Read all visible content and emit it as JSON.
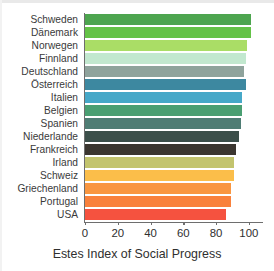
{
  "chart_data": {
    "type": "bar",
    "orientation": "horizontal",
    "title": "",
    "xlabel": "Estes Index of Social Progress",
    "ylabel": "",
    "xlim": [
      0,
      108
    ],
    "axis_max_tick": 100,
    "xticks": [
      0,
      20,
      40,
      60,
      80,
      100
    ],
    "xtick_labels": [
      "0",
      "20",
      "40",
      "60",
      "80",
      "100"
    ],
    "grid": false,
    "legend": null,
    "categories": [
      "Schweden",
      "Dänemark",
      "Norwegen",
      "Finnland",
      "Deutschland",
      "Österreich",
      "Italien",
      "Belgien",
      "Spanien",
      "Niederlande",
      "Frankreich",
      "Irland",
      "Schweiz",
      "Griechenland",
      "Portugal",
      "USA"
    ],
    "values": [
      101,
      101,
      99,
      98,
      97,
      98,
      96,
      96,
      95,
      94,
      92,
      91,
      91,
      89,
      89,
      86
    ],
    "colors": [
      "#4da54f",
      "#64c247",
      "#aadd66",
      "#c2e8cf",
      "#8fa39c",
      "#3d88a0",
      "#46a8c8",
      "#4a9f72",
      "#4f7d74",
      "#3c4f4a",
      "#3b3630",
      "#c3c46e",
      "#fbbe4a",
      "#f99640",
      "#f9813c",
      "#f5523f"
    ]
  }
}
